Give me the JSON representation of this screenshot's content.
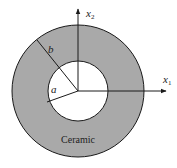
{
  "figure": {
    "type": "annular cross-section",
    "colors": {
      "ring_fill": "#a9a9a9",
      "inner_fill": "#ffffff",
      "line": "#1a1a1a"
    },
    "axes": {
      "x1": {
        "label": "x",
        "subscript": "1"
      },
      "x2": {
        "label": "x",
        "subscript": "2"
      }
    },
    "radii": {
      "inner": {
        "label": "a"
      },
      "outer": {
        "label": "b"
      }
    },
    "material_label": "Ceramic"
  }
}
